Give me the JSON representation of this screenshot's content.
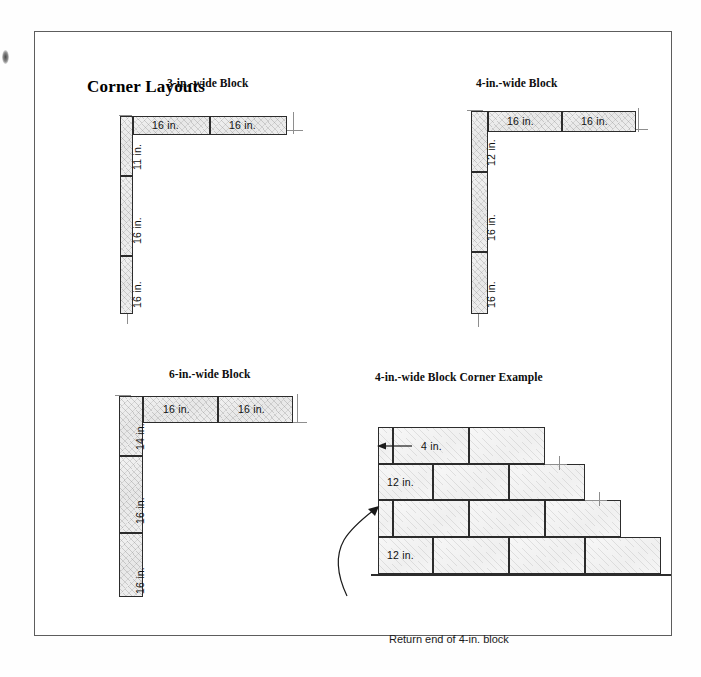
{
  "figure": {
    "title": "Corner Layouts"
  },
  "panels": [
    {
      "id": "three-inch",
      "title": "3-in.-wide Block",
      "vertical_labels": [
        "11 in.",
        "16 in.",
        "16 in."
      ],
      "horizontal_labels": [
        "16 in.",
        "16 in."
      ]
    },
    {
      "id": "four-inch",
      "title": "4-in.-wide Block",
      "vertical_labels": [
        "12 in.",
        "16 in.",
        "16 in."
      ],
      "horizontal_labels": [
        "16 in.",
        "16 in."
      ]
    },
    {
      "id": "six-inch",
      "title": "6-in.-wide Block",
      "vertical_labels": [
        "14 in.",
        "16 in.",
        "16 in."
      ],
      "horizontal_labels": [
        "16 in.",
        "16 in."
      ]
    },
    {
      "id": "corner-example",
      "title": "4-in.-wide Block Corner Example",
      "dimension_labels": [
        "4 in.",
        "12 in.",
        "12 in."
      ],
      "callout": "Return end of 4-in. block"
    }
  ],
  "labels": {
    "three_v1": "11 in.",
    "three_v2": "16 in.",
    "three_v3": "16 in.",
    "three_h1": "16 in.",
    "three_h2": "16 in.",
    "four_v1": "12 in.",
    "four_v2": "16 in.",
    "four_v3": "16 in.",
    "four_h1": "16 in.",
    "four_h2": "16 in.",
    "six_v1": "14 in.",
    "six_v2": "16 in.",
    "six_v3": "16 in.",
    "six_h1": "16 in.",
    "six_h2": "16 in.",
    "ex_top": "4 in.",
    "ex_second": "12 in.",
    "ex_bottom": "12 in.",
    "ex_callout": "Return end of 4-in. block"
  },
  "colors": {
    "frame": "#5d5d5d",
    "block_outline": "#2c2c2c",
    "block_fill": "#efefef",
    "guide": "#8e8e8e",
    "text": "#111111"
  }
}
